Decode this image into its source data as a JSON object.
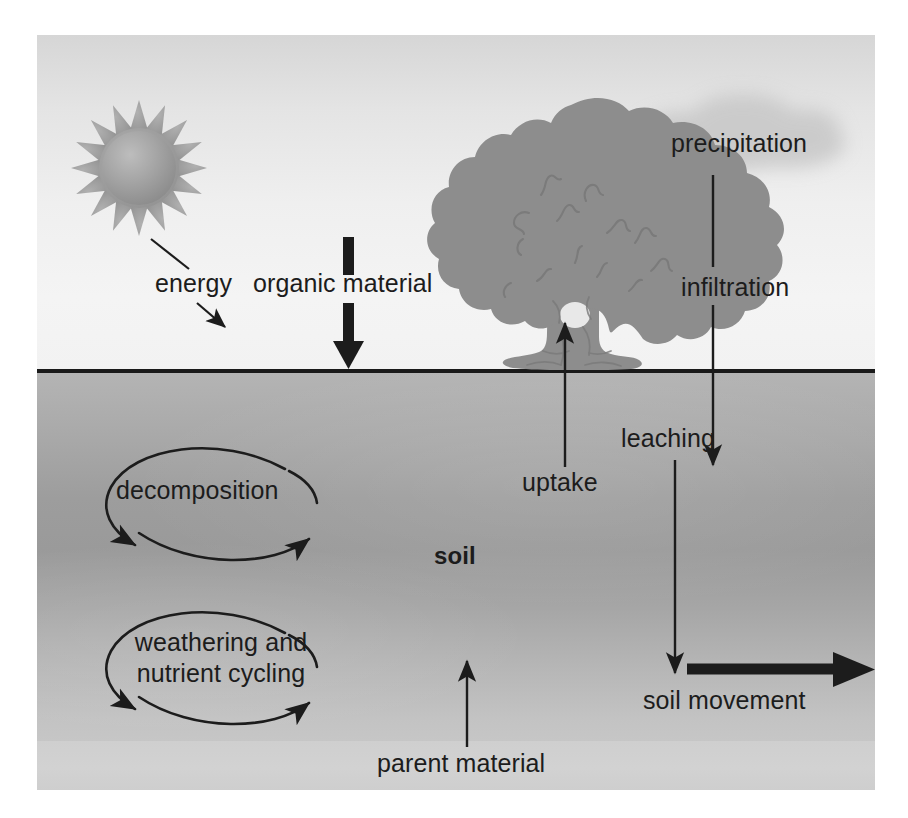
{
  "diagram": {
    "type": "conceptual-cycle-diagram",
    "layers": [
      {
        "name": "sky",
        "label": ""
      },
      {
        "name": "soil",
        "label": "soil"
      },
      {
        "name": "parent material",
        "label": "parent material"
      }
    ],
    "colors": {
      "sky": "#efefef",
      "soil_top": "#b4b4b4",
      "soil_mid": "#9a9a9a",
      "soil_bottom": "#c3c3c3",
      "parent_material": "#d0d0d0",
      "ground_line": "#1a1a1a",
      "arrow": "#1c1c1c",
      "sun": "#9a9a9a",
      "tree": "#8e8e8e",
      "cloud": "#cfcfcf",
      "text": "#1c1c1c"
    },
    "labels": {
      "energy": "energy",
      "organic_material": "organic material",
      "precipitation": "precipitation",
      "infiltration": "infiltration",
      "uptake": "uptake",
      "leaching": "leaching",
      "soil": "soil",
      "decomposition": "decomposition",
      "weathering": "weathering and nutrient cycling",
      "soil_movement": "soil movement",
      "parent_material": "parent material"
    },
    "icons": {
      "sun": "sun-icon",
      "tree": "tree-icon",
      "cloud": "cloud-icon"
    },
    "flows": [
      {
        "name": "energy",
        "from": "sun",
        "to": "ground surface",
        "direction": "down-right",
        "style": "thin"
      },
      {
        "name": "organic material",
        "from": "above surface",
        "to": "ground surface",
        "direction": "down",
        "style": "thick"
      },
      {
        "name": "precipitation",
        "from": "cloud",
        "to": "infiltration",
        "direction": "down",
        "style": "thin"
      },
      {
        "name": "infiltration",
        "from": "ground surface",
        "to": "soil",
        "direction": "down",
        "style": "thin"
      },
      {
        "name": "uptake",
        "from": "soil",
        "to": "tree",
        "direction": "up",
        "style": "thin"
      },
      {
        "name": "leaching",
        "from": "upper soil",
        "to": "lower soil",
        "direction": "down",
        "style": "thin"
      },
      {
        "name": "decomposition",
        "from": "soil",
        "to": "soil",
        "direction": "cycle",
        "style": "thin"
      },
      {
        "name": "weathering and nutrient cycling",
        "from": "soil",
        "to": "soil",
        "direction": "cycle",
        "style": "thin"
      },
      {
        "name": "soil movement",
        "from": "soil",
        "to": "right edge",
        "direction": "right",
        "style": "thick"
      },
      {
        "name": "parent material",
        "from": "parent material",
        "to": "soil",
        "direction": "up",
        "style": "thin"
      }
    ]
  }
}
